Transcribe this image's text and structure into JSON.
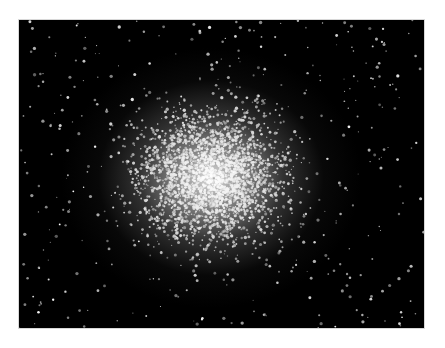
{
  "image": {
    "subject": "globular star cluster",
    "alt": "Dense globular star cluster on a black sky background",
    "background_color": "#000000",
    "core_color": "#ebebeb",
    "page_background": "#ffffff"
  }
}
